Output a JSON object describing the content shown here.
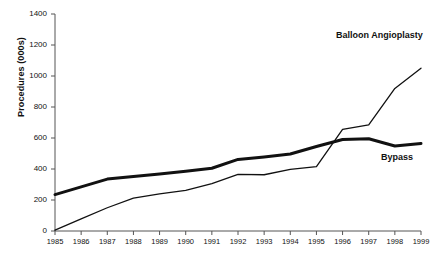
{
  "chart_data": {
    "type": "line",
    "title": "",
    "xlabel": "",
    "ylabel": "Procedures (000s)",
    "x": [
      1985,
      1986,
      1987,
      1988,
      1989,
      1990,
      1991,
      1992,
      1993,
      1994,
      1995,
      1996,
      1997,
      1998,
      1999
    ],
    "xticklabels": [
      "1985",
      "1986",
      "1987",
      "1988",
      "1989",
      "1990",
      "1991",
      "1992",
      "1993",
      "1994",
      "1995",
      "1996",
      "1997",
      "1998",
      "1999"
    ],
    "yticks": [
      0,
      200,
      400,
      600,
      800,
      1000,
      1200,
      1400
    ],
    "yticklabels": [
      "0",
      "200",
      "400",
      "600",
      "800",
      "1000",
      "1200",
      "1400"
    ],
    "ylim": [
      0,
      1400
    ],
    "xlim": [
      1985,
      1999
    ],
    "grid": false,
    "legend_position": "inline-right",
    "series": [
      {
        "name": "Bypass",
        "style": "thick",
        "color": "#111111",
        "linewidth": 3,
        "values": [
          235,
          285,
          335,
          352,
          368,
          385,
          405,
          462,
          478,
          497,
          545,
          590,
          595,
          548,
          565
        ]
      },
      {
        "name": "Balloon Angioplasty",
        "style": "thin",
        "color": "#111111",
        "linewidth": 1.3,
        "values": [
          5,
          78,
          150,
          212,
          240,
          262,
          305,
          365,
          363,
          398,
          415,
          655,
          685,
          920,
          1050
        ]
      }
    ],
    "annotations": [
      {
        "text": "Balloon Angioplasty",
        "series": "Balloon Angioplasty"
      },
      {
        "text": "Bypass",
        "series": "Bypass"
      }
    ]
  },
  "footnote": ""
}
